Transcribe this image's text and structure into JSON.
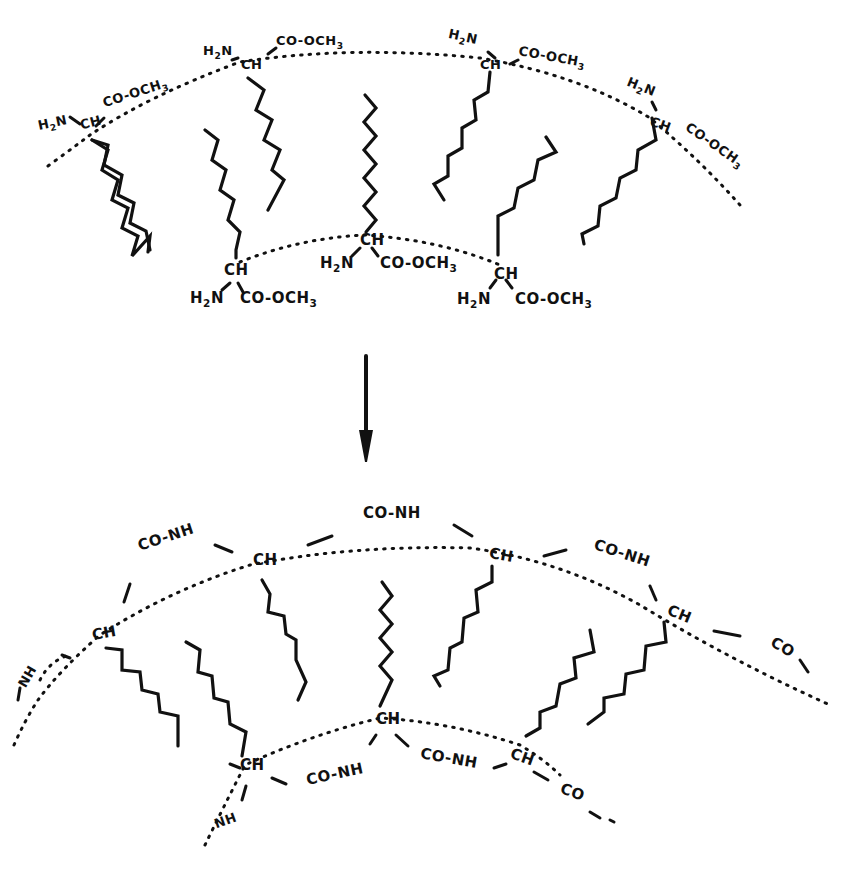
{
  "diagram": {
    "top_panel": {
      "name": "amino-acid-ester-aggregate",
      "groups": [
        {
          "ch": "CH",
          "amine": "H2N",
          "ester": "CO-OCH3"
        },
        {
          "ch": "CH",
          "amine": "H2N",
          "ester": "CO-OCH3"
        },
        {
          "ch": "CH",
          "amine": "H2N",
          "ester": "CO-OCH3"
        },
        {
          "ch": "CH",
          "amine": "H2N",
          "ester": "CO-OCH3"
        },
        {
          "ch": "CH",
          "amine": "H2N",
          "ester": "CO-OCH3"
        },
        {
          "ch": "CH",
          "amine": "H2N",
          "ester": "CO-OCH3"
        },
        {
          "ch": "CH",
          "amine": "H2N",
          "ester": "CO-OCH3"
        }
      ]
    },
    "arrow": {
      "direction": "down"
    },
    "bottom_panel": {
      "name": "polyamide-network",
      "labels": {
        "ch": "CH",
        "amide": "CO-NH",
        "nh": "NH",
        "co": "CO"
      }
    }
  }
}
